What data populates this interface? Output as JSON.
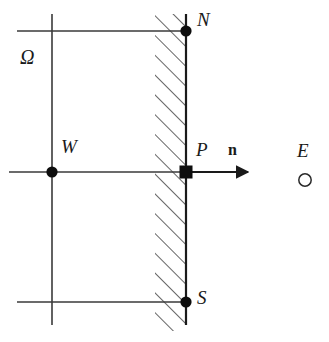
{
  "figure": {
    "kind": "finite-volume-boundary-cell-diagram",
    "background_color": "#ffffff",
    "line_color": "#3a3a3a",
    "marker_color": "#0d0d0d",
    "hatch_color": "#4a4a4a",
    "width": 329,
    "height": 342
  },
  "labels": {
    "domain": "Ω",
    "west_node": "W",
    "north_node": "N",
    "boundary_node": "P",
    "south_node": "S",
    "normal_vector": "n",
    "east_node": "E"
  },
  "nodes": [
    {
      "id": "N",
      "label": "N",
      "marker": "filled-circle",
      "x": 186,
      "y": 31
    },
    {
      "id": "P",
      "label": "P",
      "marker": "filled-square",
      "x": 186,
      "y": 172
    },
    {
      "id": "S",
      "label": "S",
      "marker": "filled-circle",
      "x": 186,
      "y": 302
    },
    {
      "id": "W",
      "label": "W",
      "marker": "filled-circle",
      "x": 52,
      "y": 172
    },
    {
      "id": "E",
      "label": "E",
      "marker": "open-circle",
      "x": 305,
      "y": 180
    }
  ],
  "grid": {
    "vertical_lines": [
      {
        "name": "west-gridline",
        "x": 52,
        "y1": 14,
        "y2": 325
      },
      {
        "name": "boundary-face-line",
        "x": 186,
        "y1": 14,
        "y2": 325
      }
    ],
    "horizontal_lines": [
      {
        "name": "north-gridline",
        "y": 31,
        "x1": 17,
        "x2": 186
      },
      {
        "name": "center-gridline",
        "y": 172,
        "x1": 9,
        "x2": 186
      },
      {
        "name": "south-gridline",
        "y": 302,
        "x1": 17,
        "x2": 186
      }
    ]
  },
  "hatched_band": {
    "name": "boundary-hatched-band",
    "x_left": 155,
    "x_right": 186,
    "y_top": 14,
    "y_bottom": 331,
    "angle_degrees": 45,
    "direction": "lower-left-to-upper-right"
  },
  "normal_arrow": {
    "name": "outward-normal-arrow",
    "x_start": 186,
    "x_end": 252,
    "y": 172
  }
}
